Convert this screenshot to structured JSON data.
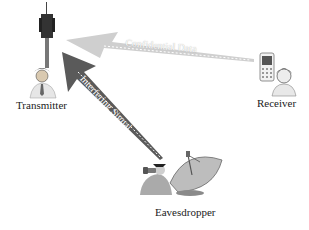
{
  "diagram": {
    "nodes": [
      {
        "id": "transmitter",
        "label": "Transmitter",
        "icon": "cell-tower-person-icon"
      },
      {
        "id": "receiver",
        "label": "Receiver",
        "icon": "mobile-phone-person-icon"
      },
      {
        "id": "eavesdropper",
        "label": "Eavesdropper",
        "icon": "satellite-dish-spy-icon"
      }
    ],
    "edges": [
      {
        "from": "receiver",
        "to": "transmitter",
        "label": "Confidential Data",
        "color": "#c8c8c8"
      },
      {
        "from": "eavesdropper",
        "to": "transmitter",
        "label": "Interfering Signal",
        "color": "#555555"
      }
    ]
  }
}
